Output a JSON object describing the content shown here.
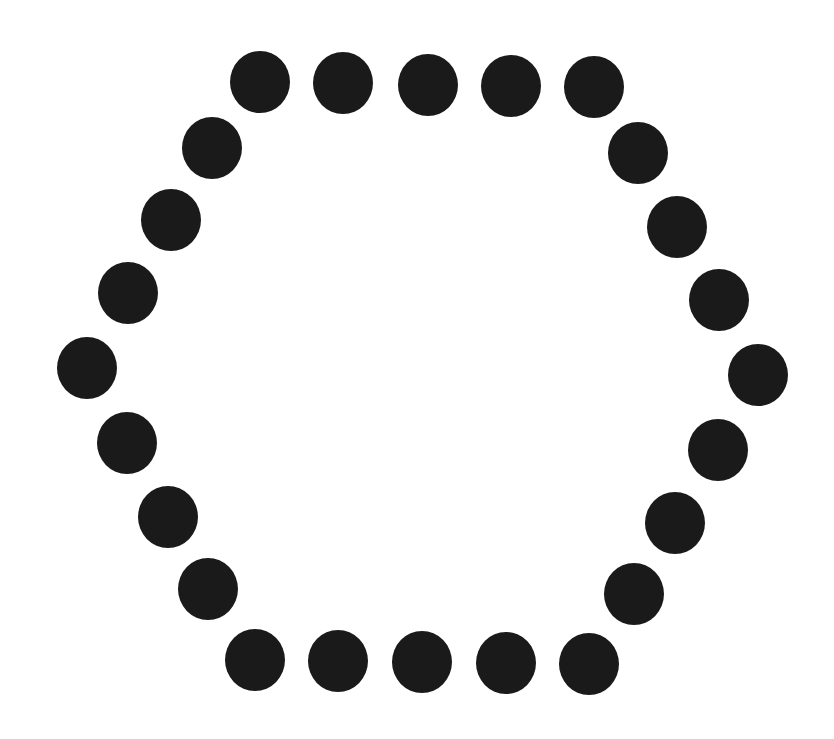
{
  "figure": {
    "shape": "hexagon of dots",
    "dot_count": 26,
    "dot_color": "#1a1a1a",
    "background": "#ffffff",
    "dot_diameter": 62,
    "dots": [
      {
        "edge": "top",
        "x": 260,
        "y": 82
      },
      {
        "edge": "top",
        "x": 343,
        "y": 83
      },
      {
        "edge": "top",
        "x": 428,
        "y": 85
      },
      {
        "edge": "top",
        "x": 511,
        "y": 86
      },
      {
        "edge": "top",
        "x": 594,
        "y": 87
      },
      {
        "edge": "upper-right",
        "x": 638,
        "y": 153
      },
      {
        "edge": "upper-right",
        "x": 677,
        "y": 227
      },
      {
        "edge": "upper-right",
        "x": 719,
        "y": 300
      },
      {
        "edge": "right-vertex",
        "x": 758,
        "y": 375
      },
      {
        "edge": "lower-right",
        "x": 718,
        "y": 450
      },
      {
        "edge": "lower-right",
        "x": 675,
        "y": 523
      },
      {
        "edge": "lower-right",
        "x": 634,
        "y": 594
      },
      {
        "edge": "bottom",
        "x": 589,
        "y": 664
      },
      {
        "edge": "bottom",
        "x": 506,
        "y": 663
      },
      {
        "edge": "bottom",
        "x": 422,
        "y": 662
      },
      {
        "edge": "bottom",
        "x": 338,
        "y": 661
      },
      {
        "edge": "bottom",
        "x": 255,
        "y": 660
      },
      {
        "edge": "lower-left",
        "x": 208,
        "y": 589
      },
      {
        "edge": "lower-left",
        "x": 168,
        "y": 517
      },
      {
        "edge": "lower-left",
        "x": 127,
        "y": 443
      },
      {
        "edge": "left-vertex",
        "x": 87,
        "y": 368
      },
      {
        "edge": "upper-left",
        "x": 128,
        "y": 293
      },
      {
        "edge": "upper-left",
        "x": 171,
        "y": 220
      },
      {
        "edge": "upper-left",
        "x": 212,
        "y": 148
      }
    ]
  }
}
